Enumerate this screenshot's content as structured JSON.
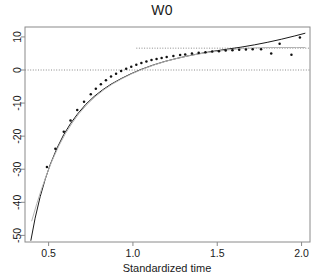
{
  "chart_data": {
    "type": "scatter",
    "title": "W0",
    "xlabel": "Standardized time",
    "ylabel": "",
    "xlim": [
      0.36,
      2.05
    ],
    "ylim": [
      -52,
      13
    ],
    "xticks": [
      0.5,
      1.0,
      1.5,
      2.0
    ],
    "xtick_labels": [
      "0.5",
      "1.0",
      "1.5",
      "2.0"
    ],
    "yticks": [
      10,
      0,
      -10,
      -20,
      -30,
      -40,
      -50
    ],
    "ytick_labels": [
      "10",
      "0",
      "-10",
      "-20",
      "-30",
      "-40",
      "-50"
    ],
    "grid": false,
    "legend": null,
    "points": {
      "name": "observed",
      "marker": "dot",
      "color": "#111111",
      "x": [
        0.49,
        0.54,
        0.59,
        0.63,
        0.67,
        0.71,
        0.75,
        0.78,
        0.81,
        0.84,
        0.87,
        0.9,
        0.93,
        0.96,
        0.99,
        1.02,
        1.05,
        1.08,
        1.11,
        1.14,
        1.17,
        1.2,
        1.24,
        1.28,
        1.31,
        1.35,
        1.39,
        1.43,
        1.47,
        1.51,
        1.55,
        1.59,
        1.63,
        1.67,
        1.71,
        1.76,
        1.82,
        1.87,
        1.94,
        1.99
      ],
      "y": [
        -29.3,
        -23.8,
        -18.7,
        -15.3,
        -12.1,
        -9.6,
        -7.3,
        -5.7,
        -4.3,
        -3.1,
        -2.0,
        -1.1,
        -0.3,
        0.4,
        1.0,
        1.6,
        2.1,
        2.6,
        3.0,
        3.3,
        3.6,
        3.9,
        4.2,
        4.5,
        4.7,
        5.0,
        5.2,
        5.4,
        5.6,
        5.7,
        5.9,
        6.0,
        6.1,
        6.2,
        6.3,
        6.3,
        5.0,
        7.9,
        4.6,
        9.8
      ]
    },
    "curves": [
      {
        "name": "fitted-dark",
        "color": "#1a1a1a",
        "style": "solid",
        "x": [
          0.395,
          0.42,
          0.45,
          0.48,
          0.51,
          0.55,
          0.59,
          0.63,
          0.67,
          0.72,
          0.77,
          0.82,
          0.87,
          0.93,
          0.99,
          1.05,
          1.12,
          1.19,
          1.26,
          1.33,
          1.4,
          1.48,
          1.56,
          1.64,
          1.72,
          1.8,
          1.88,
          1.96,
          2.02
        ],
        "y": [
          -51.5,
          -44.8,
          -38.3,
          -33.0,
          -28.5,
          -23.6,
          -19.5,
          -16.2,
          -13.4,
          -10.4,
          -8.0,
          -6.0,
          -4.3,
          -2.6,
          -1.1,
          0.2,
          1.5,
          2.6,
          3.5,
          4.3,
          5.0,
          5.7,
          6.3,
          6.9,
          7.6,
          8.4,
          9.3,
          10.3,
          11.1
        ]
      },
      {
        "name": "fitted-gray",
        "color": "#b4b4b4",
        "style": "solid",
        "x": [
          0.4,
          0.43,
          0.46,
          0.49,
          0.52,
          0.56,
          0.6,
          0.64,
          0.68,
          0.73,
          0.78,
          0.83,
          0.88,
          0.94,
          1.0,
          1.06,
          1.13,
          1.2,
          1.27,
          1.34,
          1.41,
          1.49,
          1.57,
          1.65,
          1.73,
          1.81,
          1.89,
          1.97,
          2.02
        ],
        "y": [
          -45.6,
          -40.4,
          -35.7,
          -31.4,
          -27.5,
          -23.0,
          -19.2,
          -16.0,
          -13.2,
          -10.3,
          -7.9,
          -5.9,
          -4.2,
          -2.5,
          -1.0,
          0.3,
          1.6,
          2.7,
          3.6,
          4.4,
          5.0,
          5.6,
          6.1,
          6.5,
          6.7,
          6.8,
          6.8,
          6.8,
          6.8
        ]
      }
    ],
    "reference_lines": [
      {
        "name": "zero-line",
        "orientation": "horizontal",
        "value": 0,
        "style": "dotted",
        "color": "#8a8a8a",
        "x_start": 0.36,
        "x_end": 2.05
      },
      {
        "name": "upper-asymptote-line",
        "orientation": "horizontal",
        "value": 6.6,
        "style": "dotted",
        "color": "#8a8a8a",
        "x_start": 1.02,
        "x_end": 2.05
      }
    ]
  }
}
